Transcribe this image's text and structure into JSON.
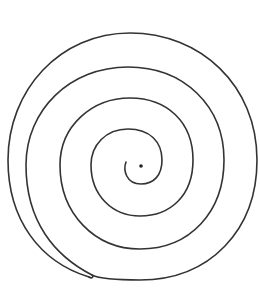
{
  "image": {
    "subject": "hand-drawn spiral",
    "background_color": "#ffffff",
    "stroke_color": "#333333",
    "turns": 4,
    "has_center_dot": true
  }
}
